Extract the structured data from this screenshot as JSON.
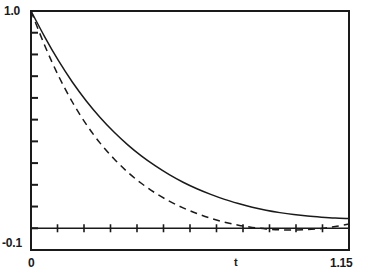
{
  "chart_data": {
    "type": "line",
    "title": "",
    "xlabel": "t",
    "ylabel": "",
    "xlim": [
      0,
      1.15
    ],
    "ylim": [
      -0.1,
      1.0
    ],
    "grid": false,
    "legend": "none",
    "x_tick_labels": [
      "0",
      "1.15"
    ],
    "y_tick_labels": [
      "1.0",
      "-0.1"
    ],
    "x_minor_tick_count": 11,
    "y_minor_tick_count": 10,
    "annotations": [],
    "series": [
      {
        "name": "solid",
        "style": "solid",
        "color": "#1a1a1a",
        "x": [
          0.0,
          0.05,
          0.1,
          0.15,
          0.2,
          0.25,
          0.3,
          0.35,
          0.4,
          0.45,
          0.5,
          0.55,
          0.6,
          0.65,
          0.7,
          0.75,
          0.8,
          0.85,
          0.9,
          0.95,
          1.0,
          1.05,
          1.1,
          1.15
        ],
        "values": [
          1.0,
          0.88,
          0.77,
          0.672,
          0.586,
          0.51,
          0.443,
          0.384,
          0.332,
          0.287,
          0.247,
          0.212,
          0.182,
          0.156,
          0.133,
          0.114,
          0.097,
          0.083,
          0.072,
          0.063,
          0.056,
          0.051,
          0.047,
          0.045
        ]
      },
      {
        "name": "dashed",
        "style": "dashed",
        "color": "#1a1a1a",
        "x": [
          0.0,
          0.05,
          0.1,
          0.15,
          0.2,
          0.25,
          0.3,
          0.35,
          0.4,
          0.45,
          0.5,
          0.55,
          0.6,
          0.65,
          0.7,
          0.75,
          0.8,
          0.85,
          0.9,
          0.95,
          1.0,
          1.05,
          1.1,
          1.15
        ],
        "values": [
          1.0,
          0.84,
          0.7,
          0.58,
          0.478,
          0.392,
          0.32,
          0.258,
          0.206,
          0.162,
          0.125,
          0.094,
          0.068,
          0.046,
          0.028,
          0.014,
          0.004,
          -0.003,
          -0.007,
          -0.008,
          -0.006,
          -0.001,
          0.008,
          0.02
        ]
      }
    ]
  }
}
